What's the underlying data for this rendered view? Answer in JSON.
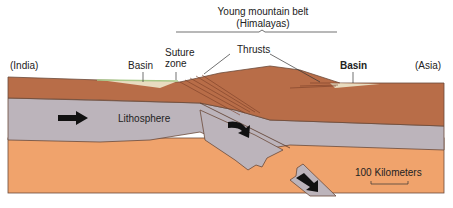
{
  "diagram": {
    "title_line1": "Young mountain belt",
    "title_line2": "(Himalayas)",
    "labels": {
      "india": "(India)",
      "asia": "(Asia)",
      "basin_left": "Basin",
      "basin_right": "Basin",
      "suture_line1": "Suture",
      "suture_line2": "zone",
      "thrusts": "Thrusts",
      "lithosphere": "Lithosphere",
      "scale": "100 Kilometers"
    },
    "colors": {
      "crust": "#b86d48",
      "crust_dark": "#8a4a30",
      "lithosphere": "#bcb4bb",
      "asthenosphere": "#f0a36c",
      "basin_sediment": "#e8dcc0",
      "basin_green": "#a9c98a",
      "outline": "#6b4a3a",
      "arrow": "#111111"
    }
  }
}
